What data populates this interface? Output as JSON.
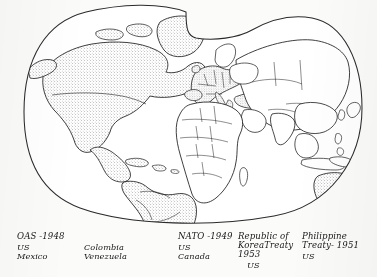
{
  "figure": {
    "kind": "world-map",
    "projection_name": "interrupted-oval",
    "shading_legend": "stippled areas denote member states of United States alliance systems",
    "outline_color": "#1d1d1d",
    "stipple_color": "#5b5b5b",
    "ocean_color": "#ffffff",
    "shaded_regions": [
      "United States",
      "Canada",
      "Mexico",
      "Greenland",
      "Central America",
      "Caribbean",
      "Colombia",
      "Venezuela",
      "Brazil",
      "Peru",
      "Chile",
      "Argentina",
      "Western Europe",
      "Turkey",
      "Australia",
      "New Zealand"
    ]
  },
  "treaty_table": {
    "columns": [
      {
        "id": "oas",
        "title": "OAS -1948",
        "members_left": [
          "US",
          "Mexico"
        ],
        "members_right": [
          "Colombia",
          "Venezuela"
        ]
      },
      {
        "id": "nato",
        "title": "NATO -1949",
        "members_left": [
          "US",
          "Canada"
        ],
        "members_right": []
      },
      {
        "id": "korea",
        "title": "Republic of\nKoreaTreaty\n1953",
        "members_left": [
          "US"
        ],
        "members_right": []
      },
      {
        "id": "philippine",
        "title": "Philippine\nTreaty- 1951",
        "members_left": [
          "US"
        ],
        "members_right": []
      }
    ]
  }
}
